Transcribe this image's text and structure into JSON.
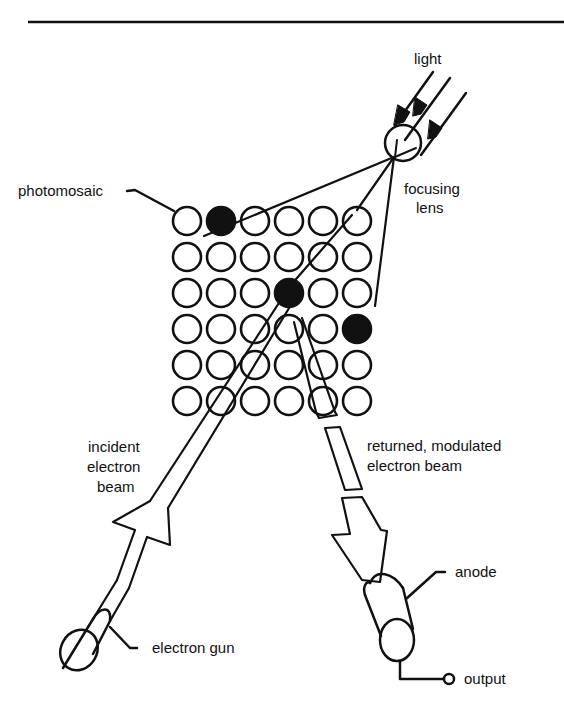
{
  "diagram": {
    "type": "image orthicon / iconoscope camera tube schematic",
    "colors": {
      "ink": "#111111",
      "background": "#ffffff"
    },
    "grid": {
      "rows": 6,
      "cols": 6,
      "filled_cells": [
        [
          0,
          1
        ],
        [
          2,
          3
        ],
        [
          3,
          5
        ]
      ]
    },
    "labels": {
      "light": "light",
      "focusing_lens_line1": "focusing",
      "focusing_lens_line2": "lens",
      "photomosaic": "photomosaic",
      "incident_line1": "incident",
      "incident_line2": "electron",
      "incident_line3": "beam",
      "returned_line1": "returned, modulated",
      "returned_line2": "electron beam",
      "electron_gun": "electron gun",
      "anode": "anode",
      "output": "output"
    }
  }
}
